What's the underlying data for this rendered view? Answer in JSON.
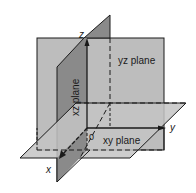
{
  "diagram": {
    "colors": {
      "background": "#ffffff",
      "yz_plane": "#bdbdbd",
      "xz_plane": "#8a8a8a",
      "xy_plane": "#c4c4c4",
      "lines": "#1a1a1a"
    },
    "planes": [
      {
        "id": "yz",
        "label": "yz plane"
      },
      {
        "id": "xz",
        "label": "xz plane"
      },
      {
        "id": "xy",
        "label": "xy plane"
      }
    ],
    "axes": [
      {
        "id": "x",
        "label": "x"
      },
      {
        "id": "y",
        "label": "y"
      },
      {
        "id": "z",
        "label": "z"
      }
    ],
    "origin_label": "0"
  }
}
